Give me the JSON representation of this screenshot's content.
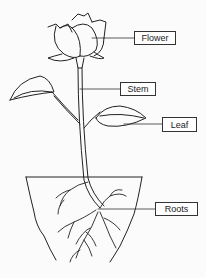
{
  "diagram": {
    "labels": [
      {
        "id": "flower",
        "text": "Flower"
      },
      {
        "id": "stem",
        "text": "Stem"
      },
      {
        "id": "leaf",
        "text": "Leaf"
      },
      {
        "id": "roots",
        "text": "Roots"
      }
    ],
    "colors": {
      "line": "#222222",
      "background": "#fbfbfb",
      "label_bg": "#ffffff"
    }
  }
}
